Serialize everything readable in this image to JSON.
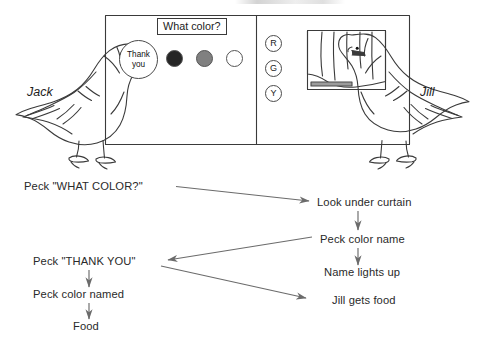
{
  "apparatus": {
    "prompt_label": "What color?",
    "speech_bubble_line1": "Thank",
    "speech_bubble_line2": "you",
    "color_keys": [
      {
        "name": "dark",
        "hex": "#262626"
      },
      {
        "name": "gray",
        "hex": "#808080"
      },
      {
        "name": "white",
        "hex": "#ffffff"
      }
    ],
    "name_keys": [
      "R",
      "G",
      "Y"
    ],
    "left_bird_label": "Jack",
    "right_bird_label": "Jill"
  },
  "flow": {
    "nodes": [
      {
        "id": "peck-what-color",
        "text": "Peck \"WHAT COLOR?\""
      },
      {
        "id": "look-under-curtain",
        "text": "Look under curtain"
      },
      {
        "id": "peck-color-name",
        "text": "Peck color name"
      },
      {
        "id": "name-lights-up",
        "text": "Name lights up"
      },
      {
        "id": "peck-thank-you",
        "text": "Peck \"THANK YOU\""
      },
      {
        "id": "jill-gets-food",
        "text": "Jill gets food"
      },
      {
        "id": "peck-color-named",
        "text": "Peck color named"
      },
      {
        "id": "food",
        "text": "Food"
      }
    ]
  },
  "colors": {
    "ink": "#2a2a2a",
    "outline": "#3a3a3a",
    "arrow": "#6b6b6b"
  }
}
